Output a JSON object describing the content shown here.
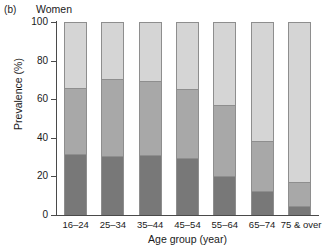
{
  "panel": {
    "letter": "(b)",
    "title": "Women"
  },
  "chart_data": {
    "type": "bar",
    "subtype": "stacked-bar-100",
    "title": "Women",
    "panel_label": "(b)",
    "xlabel": "Age group (year)",
    "ylabel": "Prevalence (%)",
    "ylim": [
      0,
      100
    ],
    "yticks": [
      0,
      20,
      40,
      60,
      80,
      100
    ],
    "ytick_labels": [
      "0",
      "20",
      "40",
      "60",
      "80",
      "100"
    ],
    "grid": false,
    "legend": "none",
    "categories": [
      "16–24",
      "25–34",
      "35–44",
      "45–54",
      "55–64",
      "65–74",
      "75 & over"
    ],
    "series": [
      {
        "name": "dark-segment",
        "color": "#787878",
        "values": [
          31.5,
          30.5,
          31.0,
          29.5,
          20.0,
          12.5,
          4.5
        ]
      },
      {
        "name": "mid-segment",
        "color": "#a8a8a8",
        "values": [
          35.0,
          40.5,
          39.0,
          36.5,
          37.5,
          26.5,
          13.0
        ]
      },
      {
        "name": "light-segment",
        "color": "#d5d5d5",
        "values": [
          33.5,
          29.0,
          30.0,
          34.0,
          42.5,
          61.0,
          82.5
        ]
      }
    ],
    "cumulative_tops": {
      "dark": [
        31.5,
        30.5,
        31.0,
        29.5,
        20.0,
        12.5,
        4.5
      ],
      "mid": [
        66.5,
        71.0,
        70.0,
        66.0,
        57.5,
        39.0,
        17.5
      ],
      "light": [
        100,
        100,
        100,
        100,
        100,
        100,
        100
      ]
    }
  },
  "colors": {
    "light": "#d5d5d5",
    "mid": "#a8a8a8",
    "dark": "#787878",
    "outline": "#8e8e8e",
    "axis": "#4a4a4a",
    "text": "#1a1a1a"
  }
}
